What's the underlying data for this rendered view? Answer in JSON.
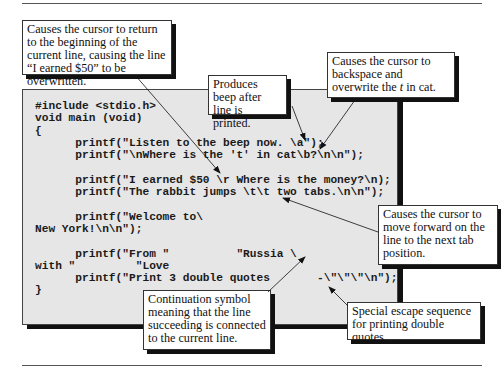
{
  "figure": {
    "code_lines": [
      "#include <stdio.h>",
      "void main (void)",
      "{",
      "      printf(\"Listen to the beep now. \\a\");",
      "      printf(\"\\nWhere is the 't' in cat\\b?\\n\\n\");",
      "",
      "      printf(\"I earned $50 \\r Where is the money?\\n);",
      "      printf(\"The rabbit jumps \\t\\t two tabs.\\n\\n\");",
      "",
      "      printf(\"Welcome to\\",
      "New York!\\n\\n\");",
      "",
      "      printf(\"From \"          \"Russia \\",
      "with \"         \"Love",
      "      printf(\"Print 3 double quotes       -\\\"\\\"\\\"\\n\");",
      "}"
    ],
    "callouts": {
      "carriage_return": "Causes the cursor to return to the beginning of the current line, causing the line “I earned $50” to be overwritten.",
      "beep": "Produces beep after line is printed.",
      "backspace_pre": "Causes the cursor to backspace and overwrite the ",
      "backspace_italic": "t",
      "backspace_post": " in cat.",
      "tab": "Causes the cursor to move forward on the line to the next tab position.",
      "continuation": "Continuation symbol meaning that the line succeeding is connected to the current line.",
      "double_quotes": "Special escape sequence for printing double quotes."
    }
  }
}
